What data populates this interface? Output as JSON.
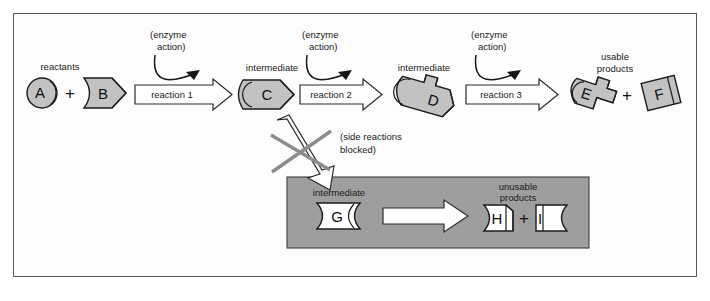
{
  "figure": {
    "border_color": "#5a5a5a",
    "background_color": "#fdfdfd",
    "molecule_fill": "#c2c2c2",
    "blocked_box_fill": "#9e9e9e"
  },
  "labels": {
    "reactants": "reactants",
    "intermediate_c": "intermediate",
    "intermediate_d": "intermediate",
    "usable_products": "usable products",
    "usable_products_line1": "usable",
    "usable_products_line2": "products",
    "intermediate_g": "intermediate",
    "unusable_products_line1": "unusable",
    "unusable_products_line2": "products",
    "enzyme_action_line1": "(enzyme",
    "enzyme_action_line2": "action)",
    "side_reactions_line1": "(side reactions",
    "side_reactions_line2": "blocked)"
  },
  "reactions": [
    {
      "id": "reaction-1",
      "label": "reaction 1"
    },
    {
      "id": "reaction-2",
      "label": "reaction 2"
    },
    {
      "id": "reaction-3",
      "label": "reaction 3"
    }
  ],
  "molecules": {
    "a": "A",
    "b": "B",
    "c": "C",
    "d": "D",
    "e": "E",
    "f": "F",
    "g": "G",
    "h": "H",
    "i": "I"
  },
  "operators": {
    "plus_reactants": "+",
    "plus_products": "+",
    "plus_unusable": "+"
  },
  "enzyme_annotations": [
    {
      "id": "enzyme-1",
      "line1": "(enzyme",
      "line2": "action)"
    },
    {
      "id": "enzyme-2",
      "line1": "(enzyme",
      "line2": "action)"
    },
    {
      "id": "enzyme-3",
      "line1": "(enzyme",
      "line2": "action)"
    }
  ]
}
